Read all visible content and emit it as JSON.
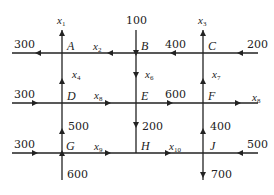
{
  "diagram": {
    "type": "traffic-flow-network",
    "nodes": [
      {
        "id": "A",
        "x": 62,
        "y": 53
      },
      {
        "id": "B",
        "x": 136,
        "y": 53
      },
      {
        "id": "C",
        "x": 203,
        "y": 53
      },
      {
        "id": "D",
        "x": 62,
        "y": 103
      },
      {
        "id": "E",
        "x": 136,
        "y": 103
      },
      {
        "id": "F",
        "x": 203,
        "y": 103
      },
      {
        "id": "G",
        "x": 62,
        "y": 153
      },
      {
        "id": "H",
        "x": 136,
        "y": 153
      },
      {
        "id": "J",
        "x": 203,
        "y": 153
      }
    ],
    "labels": {
      "in_A_left": "300",
      "in_B_top": "100",
      "in_C_right": "200",
      "in_D_left": "300",
      "out_F_right_var": "x",
      "in_G_left": "300",
      "in_G_bottom": "600",
      "in_J_right": "500",
      "out_J_bottom": "700",
      "BC": "400",
      "EF": "600",
      "EH": "200",
      "GD": "500",
      "JF": "400"
    },
    "variables": [
      {
        "name": "x",
        "sub": "1",
        "edge": "A-out-top"
      },
      {
        "name": "x",
        "sub": "2",
        "edge": "B-to-A"
      },
      {
        "name": "x",
        "sub": "3",
        "edge": "C-out-top"
      },
      {
        "name": "x",
        "sub": "4",
        "edge": "D-to-A"
      },
      {
        "name": "x",
        "sub": "6",
        "edge": "B-to-E"
      },
      {
        "name": "x",
        "sub": "7",
        "edge": "F-to-C"
      },
      {
        "name": "x",
        "sub": "8",
        "edge": "D-to-E"
      },
      {
        "name": "x",
        "sub": "8",
        "edge": "F-out-right"
      },
      {
        "name": "x",
        "sub": "9",
        "edge": "G-to-H"
      },
      {
        "name": "x",
        "sub": "10",
        "edge": "H-to-J"
      }
    ],
    "edges": [
      {
        "from": "external",
        "to": "A",
        "flow": "300",
        "direction": "A-to-left-out"
      },
      {
        "from": "B",
        "to": "A",
        "flow": "x2"
      },
      {
        "from": "C",
        "to": "B",
        "flow": "400"
      },
      {
        "from": "external-right",
        "to": "C",
        "flow": "200"
      },
      {
        "from": "external-top",
        "to": "B",
        "flow": "100"
      },
      {
        "from": "A",
        "to": "external-top",
        "flow": "x1"
      },
      {
        "from": "C",
        "to": "external-top",
        "flow": "x3"
      },
      {
        "from": "D",
        "to": "A",
        "flow": "x4"
      },
      {
        "from": "B",
        "to": "E",
        "flow": "x6"
      },
      {
        "from": "F",
        "to": "C",
        "flow": "x7"
      },
      {
        "from": "external-left",
        "to": "D",
        "flow": "300"
      },
      {
        "from": "D",
        "to": "E",
        "flow": "x8"
      },
      {
        "from": "E",
        "to": "F",
        "flow": "600"
      },
      {
        "from": "F",
        "to": "external-right",
        "flow": "x8"
      },
      {
        "from": "G",
        "to": "D",
        "flow": "500"
      },
      {
        "from": "E",
        "to": "H",
        "flow": "200"
      },
      {
        "from": "J",
        "to": "F",
        "flow": "400"
      },
      {
        "from": "external-left",
        "to": "G",
        "flow": "300"
      },
      {
        "from": "G",
        "to": "H",
        "flow": "x9"
      },
      {
        "from": "H",
        "to": "J",
        "flow": "x10"
      },
      {
        "from": "external-right",
        "to": "J",
        "flow": "500"
      },
      {
        "from": "external-bottom",
        "to": "G",
        "flow": "600"
      },
      {
        "from": "J",
        "to": "external-bottom",
        "flow": "700"
      }
    ],
    "colors": {
      "line": "#222222",
      "background": "#ffffff"
    }
  }
}
